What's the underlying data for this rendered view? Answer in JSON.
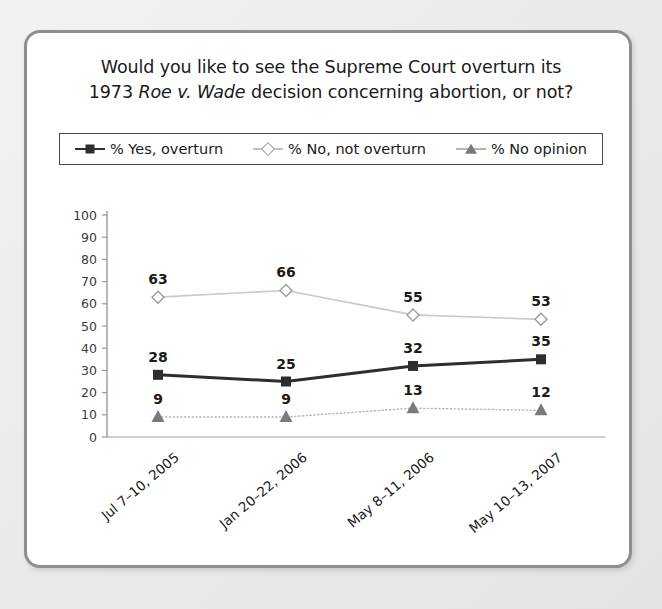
{
  "card": {
    "border_color": "#8e8e90",
    "background": "#ffffff"
  },
  "chart_data": {
    "type": "line",
    "title_line1": "Would you like to see the Supreme Court overturn its",
    "title_line2_pre": "1973 ",
    "title_line2_italic1": "Roe v. Wade",
    "title_line2_post": " decision concerning abortion, or not?",
    "title": "Would you like to see the Supreme Court overturn its 1973 Roe v. Wade decision concerning abortion, or not?",
    "xlabel": "",
    "ylabel": "",
    "ylim": [
      0,
      100
    ],
    "ytick_values": [
      0,
      10,
      20,
      30,
      40,
      50,
      60,
      70,
      80,
      90,
      100
    ],
    "ytick_labels": [
      "0",
      "10",
      "20",
      "30",
      "40",
      "50",
      "60",
      "70",
      "80",
      "90",
      "100"
    ],
    "grid": false,
    "legend_position": "top",
    "categories": [
      "Jul 7–10, 2005",
      "Jan 20–22, 2006",
      "May 8–11, 2006",
      "May 10–13, 2007"
    ],
    "series": [
      {
        "name": "% Yes, overturn",
        "values": [
          28,
          25,
          32,
          35
        ],
        "labels": [
          "28",
          "25",
          "32",
          "35"
        ],
        "color": "#2e2e2e",
        "marker": "square",
        "line_style": "solid",
        "line_width": 3
      },
      {
        "name": "% No, not overturn",
        "values": [
          63,
          66,
          55,
          53
        ],
        "labels": [
          "63",
          "66",
          "55",
          "53"
        ],
        "color": "#c9c9c9",
        "marker": "diamond",
        "marker_fill": "#ffffff",
        "marker_edge": "#9b9b9b",
        "line_style": "solid",
        "line_width": 1.6
      },
      {
        "name": "% No opinion",
        "values": [
          9,
          9,
          13,
          12
        ],
        "labels": [
          "9",
          "9",
          "13",
          "12"
        ],
        "color": "#b4b4b4",
        "marker": "triangle",
        "marker_fill": "#7a7a7a",
        "line_style": "dotted",
        "line_width": 1.4
      }
    ]
  }
}
